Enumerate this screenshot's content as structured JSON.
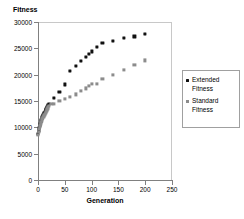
{
  "chart_data": {
    "type": "scatter",
    "title": "",
    "xlabel": "Generation",
    "ylabel": "Fitness",
    "xlim": [
      0,
      250
    ],
    "ylim": [
      0,
      30000
    ],
    "xticks": [
      0,
      50,
      100,
      150,
      200,
      250
    ],
    "yticks": [
      0,
      5000,
      10000,
      15000,
      20000,
      25000,
      30000
    ],
    "xtick_labels": [
      "0",
      "50",
      "100",
      "150",
      "200",
      "250"
    ],
    "ytick_labels": [
      "0",
      "5000",
      "10000",
      "15000",
      "20000",
      "25000",
      "30000"
    ],
    "grid": false,
    "legend_position": "right",
    "series": [
      {
        "name": "Extended Fitness",
        "marker": "diamond",
        "color": "#111111",
        "points": [
          [
            0,
            8700
          ],
          [
            1,
            9400
          ],
          [
            2,
            9900
          ],
          [
            3,
            10350
          ],
          [
            4,
            10700
          ],
          [
            5,
            11000
          ],
          [
            6,
            11300
          ],
          [
            7,
            11600
          ],
          [
            8,
            11900
          ],
          [
            9,
            12150
          ],
          [
            10,
            12400
          ],
          [
            11,
            12600
          ],
          [
            12,
            12800
          ],
          [
            13,
            13000
          ],
          [
            14,
            13200
          ],
          [
            15,
            13400
          ],
          [
            16,
            13600
          ],
          [
            17,
            13800
          ],
          [
            18,
            14000
          ],
          [
            19,
            14200
          ],
          [
            20,
            14400
          ],
          [
            30,
            15600
          ],
          [
            40,
            16650
          ],
          [
            50,
            18150
          ],
          [
            60,
            20700
          ],
          [
            70,
            21700
          ],
          [
            80,
            22600
          ],
          [
            90,
            23300
          ],
          [
            95,
            24000
          ],
          [
            100,
            24400
          ],
          [
            110,
            25200
          ],
          [
            120,
            26000
          ],
          [
            140,
            26400
          ],
          [
            160,
            27000
          ],
          [
            180,
            27250
          ],
          [
            200,
            27700
          ]
        ]
      },
      {
        "name": "Standard Fitness",
        "marker": "square",
        "color": "#8c8c8c",
        "points": [
          [
            0,
            8600
          ],
          [
            1,
            9200
          ],
          [
            2,
            9700
          ],
          [
            3,
            10100
          ],
          [
            4,
            10450
          ],
          [
            5,
            10750
          ],
          [
            6,
            11050
          ],
          [
            7,
            11300
          ],
          [
            8,
            11550
          ],
          [
            9,
            11800
          ],
          [
            10,
            12000
          ],
          [
            11,
            12200
          ],
          [
            12,
            12400
          ],
          [
            13,
            12600
          ],
          [
            14,
            12800
          ],
          [
            15,
            13000
          ],
          [
            16,
            13200
          ],
          [
            17,
            13400
          ],
          [
            18,
            13600
          ],
          [
            19,
            13800
          ],
          [
            20,
            14000
          ],
          [
            25,
            14400
          ],
          [
            30,
            14450
          ],
          [
            40,
            15050
          ],
          [
            50,
            15400
          ],
          [
            60,
            15800
          ],
          [
            70,
            16250
          ],
          [
            80,
            16900
          ],
          [
            90,
            17400
          ],
          [
            95,
            17800
          ],
          [
            100,
            18250
          ],
          [
            110,
            18300
          ],
          [
            120,
            19200
          ],
          [
            140,
            20000
          ],
          [
            160,
            20900
          ],
          [
            180,
            21800
          ],
          [
            200,
            22700
          ]
        ]
      }
    ]
  },
  "legend": {
    "items": [
      {
        "label": "Extended\nFitness",
        "marker": "diamond"
      },
      {
        "label": "Standard\nFitness",
        "marker": "square"
      }
    ]
  }
}
